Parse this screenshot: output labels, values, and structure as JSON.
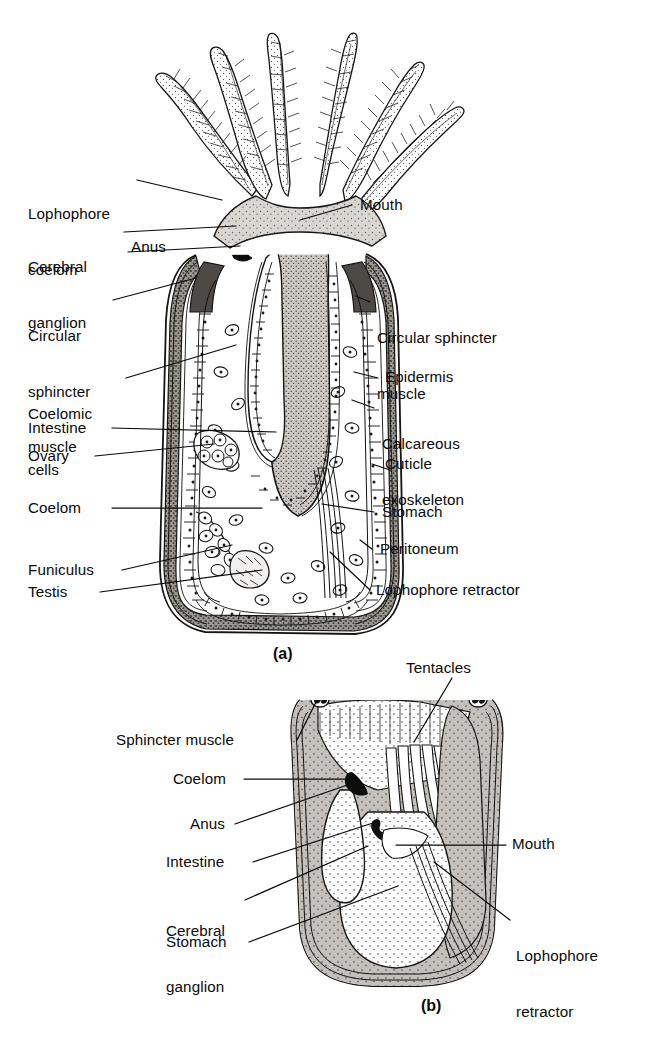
{
  "figure": {
    "type": "scientific-illustration",
    "panels": [
      {
        "id": "a",
        "caption": "(a)",
        "description": "Longitudinal section of an extended marine ectoproct zooid with lophophore",
        "labels_left": [
          {
            "text": "Lophophore\ncoelom",
            "lines": [
              "Lophophore",
              "coelom"
            ]
          },
          {
            "text": "Cerebral\nganglion",
            "lines": [
              "Cerebral",
              "ganglion"
            ]
          },
          {
            "text": "Anus",
            "lines": [
              "Anus"
            ]
          },
          {
            "text": "Circular\nsphincter\nmuscle",
            "lines": [
              "Circular",
              "sphincter",
              "muscle"
            ]
          },
          {
            "text": "Coelomic\ncells",
            "lines": [
              "Coelomic",
              "cells"
            ]
          },
          {
            "text": "Intestine",
            "lines": [
              "Intestine"
            ]
          },
          {
            "text": "Ovary",
            "lines": [
              "Ovary"
            ]
          },
          {
            "text": "Coelom",
            "lines": [
              "Coelom"
            ]
          },
          {
            "text": "Funiculus",
            "lines": [
              "Funiculus"
            ]
          },
          {
            "text": "Testis",
            "lines": [
              "Testis"
            ]
          }
        ],
        "labels_right": [
          {
            "text": "Mouth",
            "lines": [
              "Mouth"
            ]
          },
          {
            "text": "Circular sphincter\nmuscle",
            "lines": [
              "Circular sphincter",
              "muscle"
            ]
          },
          {
            "text": "Epidermis",
            "lines": [
              "Epidermis"
            ]
          },
          {
            "text": "Calcareous\nexoskeleton",
            "lines": [
              "Calcareous",
              "exoskeleton"
            ]
          },
          {
            "text": "Cuticle",
            "lines": [
              "Cuticle"
            ]
          },
          {
            "text": "Stomach",
            "lines": [
              "Stomach"
            ]
          },
          {
            "text": "Peritoneum",
            "lines": [
              "Peritoneum"
            ]
          },
          {
            "text": "Lophophore retractor",
            "lines": [
              "Lophophore retractor"
            ]
          }
        ]
      },
      {
        "id": "b",
        "caption": "(b)",
        "description": "Retracted zooid with lophophore withdrawn into the zoecium",
        "labels_left": [
          {
            "text": "Sphincter muscle",
            "lines": [
              "Sphincter muscle"
            ]
          },
          {
            "text": "Coelom",
            "lines": [
              "Coelom"
            ]
          },
          {
            "text": "Anus",
            "lines": [
              "Anus"
            ]
          },
          {
            "text": "Intestine",
            "lines": [
              "Intestine"
            ]
          },
          {
            "text": "Cerebral\nganglion",
            "lines": [
              "Cerebral",
              "ganglion"
            ]
          },
          {
            "text": "Stomach",
            "lines": [
              "Stomach"
            ]
          }
        ],
        "labels_right": [
          {
            "text": "Tentacles",
            "lines": [
              "Tentacles"
            ]
          },
          {
            "text": "Mouth",
            "lines": [
              "Mouth"
            ]
          },
          {
            "text": "Lophophore\nretractor",
            "lines": [
              "Lophophore",
              "retractor"
            ]
          }
        ]
      }
    ]
  },
  "labels": {
    "a": {
      "lophophore_coelom_1": "Lophophore",
      "lophophore_coelom_2": "coelom",
      "cerebral_ganglion_1": "Cerebral",
      "cerebral_ganglion_2": "ganglion",
      "anus": "Anus",
      "circular_sphincter_1": "Circular",
      "circular_sphincter_2": "sphincter",
      "circular_sphincter_3": "muscle",
      "coelomic_cells_1": "Coelomic",
      "coelomic_cells_2": "cells",
      "intestine": "Intestine",
      "ovary": "Ovary",
      "coelom": "Coelom",
      "funiculus": "Funiculus",
      "testis": "Testis",
      "mouth": "Mouth",
      "circ_sphincter_r_1": "Circular sphincter",
      "circ_sphincter_r_2": "muscle",
      "epidermis": "Epidermis",
      "calcareous_1": "Calcareous",
      "calcareous_2": "exoskeleton",
      "cuticle": "Cuticle",
      "stomach": "Stomach",
      "peritoneum": "Peritoneum",
      "lophophore_retractor": "Lophophore retractor",
      "caption": "(a)"
    },
    "b": {
      "sphincter_muscle": "Sphincter muscle",
      "coelom": "Coelom",
      "anus": "Anus",
      "intestine": "Intestine",
      "cerebral_ganglion_1": "Cerebral",
      "cerebral_ganglion_2": "ganglion",
      "stomach": "Stomach",
      "tentacles": "Tentacles",
      "mouth": "Mouth",
      "lophophore_retractor_1": "Lophophore",
      "lophophore_retractor_2": "retractor",
      "caption": "(b)"
    }
  },
  "colors": {
    "ink": "#0a0a0a",
    "paper": "#ffffff",
    "tissue_light": "#d5d2cd",
    "tissue_mid": "#b9b6b1",
    "tissue_dark": "#8f8c87",
    "shell_dark": "#6f6c67",
    "gut_fill": "#c9c6c1"
  }
}
